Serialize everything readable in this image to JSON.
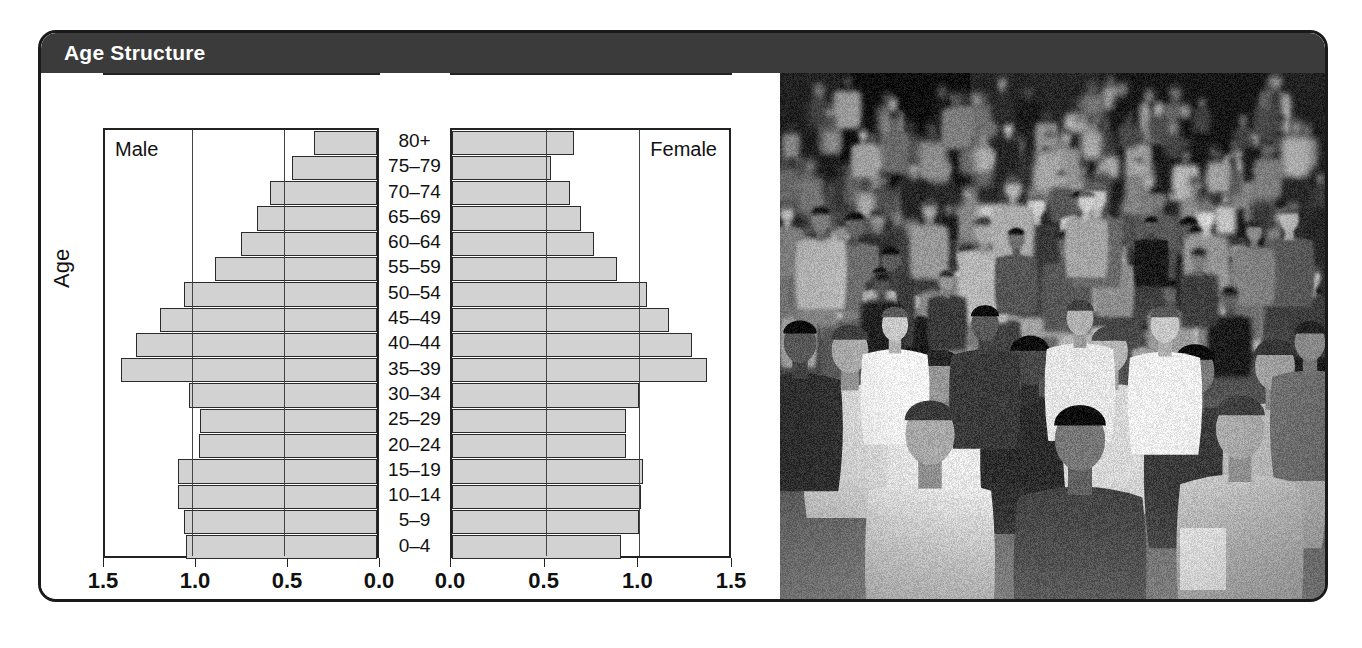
{
  "header": {
    "title": "Age Structure"
  },
  "chart_panel": {
    "male_label": "Male",
    "female_label": "Female",
    "y_axis_title": "Age",
    "x_axis_title": "Population of Canada (millions)",
    "male_ticks": [
      "1.5",
      "1.0",
      "0.5",
      "0.0"
    ],
    "female_ticks": [
      "0.0",
      "0.5",
      "1.0",
      "1.5"
    ]
  },
  "photo": {
    "alt": "Black and white photograph of a dense crowd of people walking on a city street"
  },
  "colors": {
    "header_background": "#3b3b3b",
    "header_text": "#ffffff",
    "bar_fill": "#d2d2d2",
    "bar_stroke": "#2b2b2b",
    "frame_border": "#1a1a1a",
    "axis": "#222222"
  },
  "chart_data": {
    "type": "bar",
    "title": "Age Structure",
    "subtitle": "",
    "xlabel": "Population of Canada (millions)",
    "ylabel": "Age",
    "orientation": "horizontal",
    "layout": "population-pyramid",
    "xlim": [
      0,
      1.5
    ],
    "xticks": [
      0.0,
      0.5,
      1.0,
      1.5
    ],
    "grid": true,
    "legend_position": "inside-top-corners",
    "categories": [
      "0–4",
      "5–9",
      "10–14",
      "15–19",
      "20–24",
      "25–29",
      "30–34",
      "35–39",
      "40–44",
      "45–49",
      "50–54",
      "55–59",
      "60–64",
      "65–69",
      "70–74",
      "75–79",
      "80+"
    ],
    "series": [
      {
        "name": "Male",
        "direction": "left",
        "values": [
          1.04,
          1.05,
          1.08,
          1.08,
          0.97,
          0.96,
          1.02,
          1.39,
          1.31,
          1.18,
          1.05,
          0.88,
          0.74,
          0.65,
          0.58,
          0.46,
          0.34
        ]
      },
      {
        "name": "Female",
        "direction": "right",
        "values": [
          0.9,
          1.0,
          1.01,
          1.02,
          0.93,
          0.93,
          1.0,
          1.36,
          1.28,
          1.16,
          1.04,
          0.88,
          0.76,
          0.69,
          0.63,
          0.53,
          0.65
        ]
      }
    ]
  }
}
